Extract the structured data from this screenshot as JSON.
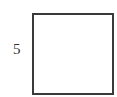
{
  "diagram": {
    "shape": "square",
    "side_label": "5",
    "colors": {
      "stroke": "#3a3a3a",
      "fill": "#ffffff",
      "label": "#333333"
    }
  }
}
